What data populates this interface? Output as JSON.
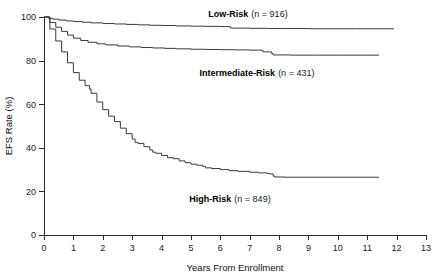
{
  "chart_data": {
    "type": "line",
    "title": "",
    "subtitle": "",
    "xlabel": "Years From Enrollment",
    "ylabel": "EFS Rate (%)",
    "xlim": [
      0,
      13
    ],
    "ylim": [
      0,
      100
    ],
    "xticks": [
      0,
      1,
      2,
      3,
      4,
      5,
      6,
      7,
      8,
      9,
      10,
      11,
      12,
      13
    ],
    "yticks": [
      0,
      20,
      40,
      60,
      80,
      100
    ],
    "xtick_labels": [
      "0",
      "1",
      "2",
      "3",
      "4",
      "5",
      "6",
      "7",
      "8",
      "9",
      "10",
      "11",
      "12",
      "13"
    ],
    "ytick_labels": [
      "0",
      "20",
      "40",
      "60",
      "80",
      "100"
    ],
    "grid": false,
    "legend_position": "inline-annotations",
    "line_color": "#3a3a3a",
    "series": [
      {
        "name": "Low-Risk",
        "n": 916,
        "label": "Low-Risk",
        "n_label": "(n = 916)",
        "final_value": 95,
        "x": [
          0.0,
          0.15,
          0.3,
          0.5,
          0.75,
          1.0,
          1.3,
          1.6,
          2.0,
          2.4,
          2.8,
          3.2,
          3.6,
          4.0,
          4.5,
          5.0,
          5.5,
          6.0,
          6.3,
          6.35,
          7.0,
          7.6,
          8.2,
          9.0,
          9.8,
          10.6,
          11.3,
          11.9
        ],
        "y": [
          100.0,
          99.4,
          99.0,
          98.6,
          98.2,
          97.9,
          97.6,
          97.3,
          97.0,
          96.8,
          96.6,
          96.4,
          96.2,
          96.1,
          95.9,
          95.8,
          95.7,
          95.6,
          95.5,
          94.9,
          94.8,
          94.7,
          94.7,
          94.6,
          94.6,
          94.6,
          94.6,
          94.6
        ]
      },
      {
        "name": "Intermediate-Risk",
        "n": 431,
        "label": "Intermediate-Risk",
        "n_label": "(n = 431)",
        "final_value": 82.5,
        "x": [
          0.0,
          0.2,
          0.4,
          0.6,
          0.8,
          1.0,
          1.25,
          1.5,
          1.8,
          2.1,
          2.5,
          2.9,
          3.3,
          3.7,
          4.1,
          4.5,
          5.0,
          5.5,
          6.0,
          6.5,
          7.0,
          7.4,
          7.45,
          7.7,
          7.75,
          7.8,
          8.4,
          9.2,
          10.0,
          10.8,
          11.4
        ],
        "y": [
          100.0,
          97.5,
          95.3,
          93.4,
          91.7,
          90.3,
          89.2,
          88.4,
          87.7,
          87.2,
          86.7,
          86.3,
          86.0,
          85.8,
          85.6,
          85.4,
          85.2,
          85.1,
          85.0,
          84.9,
          84.8,
          84.7,
          84.0,
          84.0,
          83.2,
          82.6,
          82.5,
          82.5,
          82.5,
          82.5,
          82.5
        ]
      },
      {
        "name": "High-Risk",
        "n": 849,
        "label": "High-Risk",
        "n_label": "(n = 849)",
        "final_value": 26.5,
        "x": [
          0.0,
          0.2,
          0.4,
          0.6,
          0.8,
          1.0,
          1.2,
          1.4,
          1.55,
          1.6,
          1.8,
          2.0,
          2.2,
          2.4,
          2.6,
          2.8,
          3.0,
          3.1,
          3.2,
          3.4,
          3.6,
          3.7,
          3.8,
          4.0,
          4.2,
          4.4,
          4.6,
          4.8,
          5.0,
          5.2,
          5.4,
          5.5,
          5.7,
          6.0,
          6.3,
          6.6,
          7.0,
          7.3,
          7.6,
          7.7,
          7.8,
          7.85,
          8.2,
          8.8,
          9.4,
          10.0,
          10.6,
          11.4
        ],
        "y": [
          100.0,
          94.5,
          89.0,
          84.0,
          79.0,
          74.5,
          71.0,
          68.5,
          67.0,
          65.0,
          61.0,
          57.5,
          54.5,
          52.0,
          49.0,
          46.5,
          44.0,
          42.5,
          42.0,
          40.5,
          39.0,
          38.0,
          37.5,
          36.5,
          35.5,
          35.0,
          34.0,
          33.2,
          32.5,
          32.0,
          31.5,
          30.8,
          30.5,
          30.0,
          29.5,
          29.2,
          28.8,
          28.5,
          28.2,
          28.0,
          27.0,
          26.6,
          26.5,
          26.5,
          26.5,
          26.5,
          26.5,
          26.5
        ]
      }
    ],
    "annotations": [
      {
        "series": "Low-Risk",
        "bold_text": "Low-Risk",
        "plain_text": "(n = 916)",
        "x_px": 248,
        "y_px": 17
      },
      {
        "series": "Intermediate-Risk",
        "bold_text": "Intermediate-Risk",
        "plain_text": "(n = 431)",
        "x_px": 257,
        "y_px": 76
      },
      {
        "series": "High-Risk",
        "bold_text": "High-Risk",
        "plain_text": "(n = 849)",
        "x_px": 230,
        "y_px": 202
      }
    ]
  }
}
